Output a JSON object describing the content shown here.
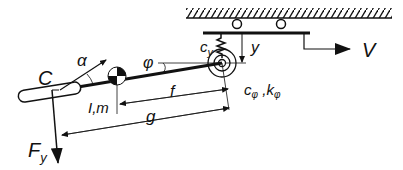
{
  "diagram": {
    "colors": {
      "stroke": "#111111",
      "background": "#ffffff",
      "thin": "#333333"
    },
    "labels": {
      "alpha": "α",
      "C": "C",
      "phi": "φ",
      "c_y": "c",
      "c_y_sub": "y",
      "y": "y",
      "V": "V",
      "Im": "I,m",
      "f": "f",
      "g": "g",
      "c_phi": "c",
      "c_phi_sub": "φ",
      "comma": " ,",
      "k_phi": "k",
      "k_phi_sub": "φ",
      "Fy": "F",
      "Fy_sub": "y"
    }
  }
}
